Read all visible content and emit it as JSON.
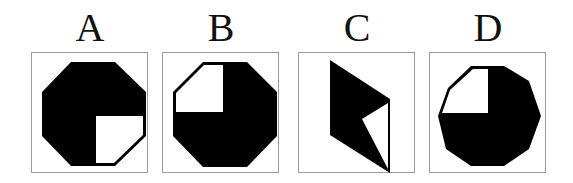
{
  "figure": {
    "type": "multiple-choice shape options",
    "colors": {
      "fill": "#000000",
      "background": "#ffffff",
      "border": "#9a9a9a"
    },
    "options": [
      {
        "label": "A",
        "shape": "regular octagon",
        "description": "Black octagon with white lower-right quadrant"
      },
      {
        "label": "B",
        "shape": "regular octagon",
        "description": "Black octagon with white upper-left quadrant"
      },
      {
        "label": "C",
        "shape": "irregular pentagon (parallelogram with notch)",
        "description": "Black parallelogram-like shape with white triangle cut from right side"
      },
      {
        "label": "D",
        "shape": "decagon",
        "description": "Black decagon with white upper-left quadrant"
      }
    ]
  }
}
